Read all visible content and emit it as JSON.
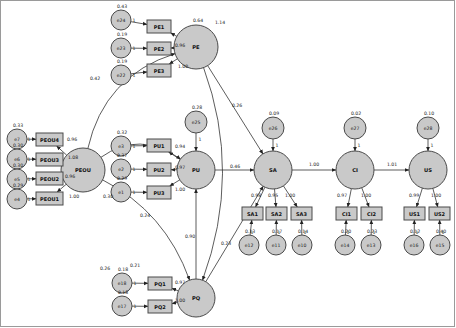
{
  "diagram": {
    "fill_color": "#c9c9c9",
    "stroke_color": "#4a4a4a",
    "latents": [
      {
        "id": "PE",
        "label": "PE",
        "cx": 196,
        "cy": 47,
        "r": 22,
        "variance": "0.64"
      },
      {
        "id": "PEOU",
        "label": "PEOU",
        "cx": 83,
        "cy": 170,
        "r": 22,
        "variance": ""
      },
      {
        "id": "PU",
        "label": "PU",
        "cx": 196,
        "cy": 170,
        "r": 19,
        "variance": ""
      },
      {
        "id": "PQ",
        "label": "PQ",
        "cx": 196,
        "cy": 298,
        "r": 19,
        "variance": ""
      },
      {
        "id": "SA",
        "label": "SA",
        "cx": 273,
        "cy": 170,
        "r": 19,
        "variance": ""
      },
      {
        "id": "CI",
        "label": "CI",
        "cx": 355,
        "cy": 170,
        "r": 19,
        "variance": ""
      },
      {
        "id": "US",
        "label": "US",
        "cx": 428,
        "cy": 170,
        "r": 19,
        "variance": ""
      }
    ],
    "indicators": [
      {
        "id": "PE1",
        "label": "PE1",
        "x": 147,
        "y": 20,
        "w": 24,
        "h": 13
      },
      {
        "id": "PE2",
        "label": "PE2",
        "x": 147,
        "y": 42,
        "w": 24,
        "h": 13
      },
      {
        "id": "PE3",
        "label": "PE3",
        "x": 147,
        "y": 64,
        "w": 24,
        "h": 13
      },
      {
        "id": "PEOU4",
        "label": "PEOU4",
        "x": 36,
        "y": 133,
        "w": 27,
        "h": 13
      },
      {
        "id": "PEOU3",
        "label": "PEOU3",
        "x": 36,
        "y": 153,
        "w": 27,
        "h": 13
      },
      {
        "id": "PEOU2",
        "label": "PEOU2",
        "x": 36,
        "y": 172,
        "w": 27,
        "h": 13
      },
      {
        "id": "PEOU1",
        "label": "PEOU1",
        "x": 36,
        "y": 192,
        "w": 27,
        "h": 13
      },
      {
        "id": "PU1",
        "label": "PU1",
        "x": 147,
        "y": 139,
        "w": 24,
        "h": 13
      },
      {
        "id": "PU2",
        "label": "PU2",
        "x": 147,
        "y": 163,
        "w": 24,
        "h": 13
      },
      {
        "id": "PU3",
        "label": "PU3",
        "x": 147,
        "y": 186,
        "w": 24,
        "h": 13
      },
      {
        "id": "PQ1",
        "label": "PQ1",
        "x": 148,
        "y": 277,
        "w": 24,
        "h": 13
      },
      {
        "id": "PQ2",
        "label": "PQ2",
        "x": 148,
        "y": 300,
        "w": 24,
        "h": 13
      },
      {
        "id": "SA1",
        "label": "SA1",
        "x": 242,
        "y": 207,
        "w": 21,
        "h": 13
      },
      {
        "id": "SA2",
        "label": "SA2",
        "x": 266,
        "y": 207,
        "w": 21,
        "h": 13
      },
      {
        "id": "SA3",
        "label": "SA3",
        "x": 291,
        "y": 207,
        "w": 21,
        "h": 13
      },
      {
        "id": "CI1",
        "label": "CI1",
        "x": 336,
        "y": 207,
        "w": 21,
        "h": 13
      },
      {
        "id": "CI2",
        "label": "CI2",
        "x": 361,
        "y": 207,
        "w": 21,
        "h": 13
      },
      {
        "id": "US1",
        "label": "US1",
        "x": 404,
        "y": 207,
        "w": 21,
        "h": 13
      },
      {
        "id": "US2",
        "label": "US2",
        "x": 429,
        "y": 207,
        "w": 21,
        "h": 13
      }
    ],
    "errors": [
      {
        "id": "e24",
        "label": "e24",
        "cx": 121,
        "cy": 20,
        "r": 10,
        "variance": "0.43"
      },
      {
        "id": "e23",
        "label": "e23",
        "cx": 121,
        "cy": 48,
        "r": 10,
        "variance": "0.19"
      },
      {
        "id": "e22",
        "label": "e22",
        "cx": 121,
        "cy": 75,
        "r": 10,
        "variance": "0.19"
      },
      {
        "id": "e7",
        "label": "e7",
        "cx": 17,
        "cy": 139,
        "r": 10,
        "variance": "0.33"
      },
      {
        "id": "e6",
        "label": "e6",
        "cx": 17,
        "cy": 159,
        "r": 10,
        "variance": "0.30"
      },
      {
        "id": "e5",
        "label": "e5",
        "cx": 17,
        "cy": 179,
        "r": 10,
        "variance": "0.30"
      },
      {
        "id": "e4",
        "label": "e4",
        "cx": 17,
        "cy": 199,
        "r": 10,
        "variance": "0.29"
      },
      {
        "id": "e3",
        "label": "e3",
        "cx": 121,
        "cy": 146,
        "r": 10,
        "variance": "0.32"
      },
      {
        "id": "e2",
        "label": "e2",
        "cx": 121,
        "cy": 169,
        "r": 10,
        "variance": "0.37"
      },
      {
        "id": "e1",
        "label": "e1",
        "cx": 121,
        "cy": 192,
        "r": 10,
        "variance": "0.29"
      },
      {
        "id": "e18",
        "label": "e18",
        "cx": 122,
        "cy": 283,
        "r": 10,
        "variance": "0.18"
      },
      {
        "id": "e17",
        "label": "e17",
        "cx": 122,
        "cy": 306,
        "r": 10,
        "variance": "0.18"
      },
      {
        "id": "e25",
        "label": "e25",
        "cx": 196,
        "cy": 122,
        "r": 11,
        "variance": "0.28"
      },
      {
        "id": "e26",
        "label": "e26",
        "cx": 273,
        "cy": 128,
        "r": 11,
        "variance": "0.09"
      },
      {
        "id": "e27",
        "label": "e27",
        "cx": 355,
        "cy": 128,
        "r": 11,
        "variance": "0.02"
      },
      {
        "id": "e28",
        "label": "e28",
        "cx": 428,
        "cy": 128,
        "r": 11,
        "variance": "0.10"
      },
      {
        "id": "e12",
        "label": "e12",
        "cx": 249,
        "cy": 245,
        "r": 10,
        "variance": "0.13"
      },
      {
        "id": "e11",
        "label": "e11",
        "cx": 276,
        "cy": 245,
        "r": 10,
        "variance": "0.17"
      },
      {
        "id": "e10",
        "label": "e10",
        "cx": 302,
        "cy": 245,
        "r": 10,
        "variance": "0.14"
      },
      {
        "id": "e14",
        "label": "e14",
        "cx": 345,
        "cy": 245,
        "r": 10,
        "variance": "0.20"
      },
      {
        "id": "e13",
        "label": "e13",
        "cx": 371,
        "cy": 245,
        "r": 10,
        "variance": "0.23"
      },
      {
        "id": "e16",
        "label": "e16",
        "cx": 414,
        "cy": 245,
        "r": 10,
        "variance": "0.12"
      },
      {
        "id": "e15",
        "label": "e15",
        "cx": 440,
        "cy": 245,
        "r": 10,
        "variance": "0.40"
      }
    ],
    "loadings": [
      {
        "from": "PE",
        "to": "PE1",
        "value": "1.14",
        "lx": 220,
        "ly": 22
      },
      {
        "from": "PE",
        "to": "PE2",
        "value": "0.96",
        "lx": 180,
        "ly": 45
      },
      {
        "from": "PE",
        "to": "PE3",
        "value": "1.00",
        "lx": 183,
        "ly": 66
      },
      {
        "from": "PEOU",
        "to": "PEOU4",
        "value": "0.96",
        "lx": 72,
        "ly": 139
      },
      {
        "from": "PEOU",
        "to": "PEOU3",
        "value": "1.08",
        "lx": 73,
        "ly": 157
      },
      {
        "from": "PEOU",
        "to": "PEOU2",
        "value": "0.96",
        "lx": 70,
        "ly": 176
      },
      {
        "from": "PEOU",
        "to": "PEOU1",
        "value": "1.00",
        "lx": 74,
        "ly": 196
      },
      {
        "from": "PU",
        "to": "PU1",
        "value": "0.94",
        "lx": 180,
        "ly": 146
      },
      {
        "from": "PU",
        "to": "PU2",
        "value": "0.97",
        "lx": 180,
        "ly": 167
      },
      {
        "from": "PU",
        "to": "PU3",
        "value": "1.00",
        "lx": 180,
        "ly": 189
      },
      {
        "from": "PQ",
        "to": "PQ1",
        "value": "0.97",
        "lx": 180,
        "ly": 282
      },
      {
        "from": "PQ",
        "to": "PQ2",
        "value": "1.00",
        "lx": 180,
        "ly": 300
      },
      {
        "from": "SA",
        "to": "SA1",
        "value": "0.98",
        "lx": 256,
        "ly": 195
      },
      {
        "from": "SA",
        "to": "SA2",
        "value": "0.95",
        "lx": 273,
        "ly": 195
      },
      {
        "from": "SA",
        "to": "SA3",
        "value": "1.00",
        "lx": 290,
        "ly": 195
      },
      {
        "from": "CI",
        "to": "CI1",
        "value": "0.97",
        "lx": 342,
        "ly": 195
      },
      {
        "from": "CI",
        "to": "CI2",
        "value": "1.00",
        "lx": 366,
        "ly": 195
      },
      {
        "from": "US",
        "to": "US1",
        "value": "0.99",
        "lx": 414,
        "ly": 195
      },
      {
        "from": "US",
        "to": "US2",
        "value": "1.00",
        "lx": 436,
        "ly": 195
      }
    ],
    "structural_paths": [
      {
        "from": "PE",
        "to": "SA",
        "value": "0.26",
        "lx": 237,
        "ly": 105
      },
      {
        "from": "PU",
        "to": "SA",
        "value": "0.46",
        "lx": 235,
        "ly": 166
      },
      {
        "from": "PQ",
        "to": "SA",
        "value": "0.23",
        "lx": 226,
        "ly": 243
      },
      {
        "from": "PQ",
        "to": "PU",
        "value": "0.90",
        "lx": 190,
        "ly": 236
      },
      {
        "from": "SA",
        "to": "CI",
        "value": "1.00",
        "lx": 314,
        "ly": 164
      },
      {
        "from": "CI",
        "to": "US",
        "value": "1.01",
        "lx": 392,
        "ly": 164
      }
    ],
    "covariances": [
      {
        "between": "PEOU-PE",
        "value": "0.42",
        "lx": 95,
        "ly": 78
      },
      {
        "between": "PEOU-PU",
        "value": "0.30",
        "lx": 108,
        "ly": 196
      },
      {
        "between": "PEOU-PQ",
        "value": "0.26",
        "lx": 105,
        "ly": 268
      },
      {
        "between": "PE-PQ",
        "value": "0.21",
        "lx": 135,
        "ly": 265
      },
      {
        "between": "PE-PU",
        "value": "0.24",
        "lx": 145,
        "ly": 215
      }
    ],
    "unit_loading_label": "1"
  }
}
